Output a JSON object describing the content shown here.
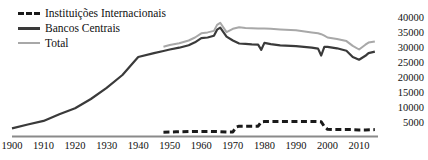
{
  "chart_data": {
    "type": "line",
    "title": "",
    "subtitle": "",
    "xlabel": "",
    "ylabel": "",
    "xlim": [
      1900,
      2016
    ],
    "ylim": [
      0,
      41000
    ],
    "grid": false,
    "legend_position": "top-left",
    "xticks": [
      1900,
      1910,
      1920,
      1930,
      1940,
      1950,
      1960,
      1970,
      1980,
      1990,
      2000,
      2010
    ],
    "xtick_labels": [
      "1900",
      "1910",
      "1920",
      "1930",
      "1940",
      "1950",
      "1960",
      "1970",
      "1980",
      "1990",
      "2000",
      "2010"
    ],
    "yticks": [
      5000,
      10000,
      15000,
      20000,
      25000,
      30000,
      35000,
      40000
    ],
    "ytick_labels": [
      "5000",
      "10000",
      "15000",
      "20000",
      "25000",
      "30000",
      "35000",
      "40000"
    ],
    "yaxis_side": "right",
    "series": [
      {
        "name": "Instituições Internacionais",
        "style": "dashed",
        "color": "#1a1a1a",
        "x": [
          1948,
          1950,
          1952,
          1954,
          1956,
          1958,
          1960,
          1962,
          1964,
          1966,
          1968,
          1970,
          1971,
          1972,
          1974,
          1976,
          1978,
          1979,
          1980,
          1982,
          1985,
          1990,
          1995,
          1997,
          1998,
          1999,
          2000,
          2002,
          2005,
          2008,
          2010,
          2012,
          2015
        ],
        "values": [
          1450,
          1500,
          1550,
          1600,
          1650,
          1700,
          1700,
          1700,
          1650,
          1600,
          1500,
          1500,
          3100,
          3450,
          3450,
          3450,
          3450,
          4900,
          5000,
          5000,
          5000,
          5000,
          5000,
          4950,
          4900,
          3300,
          2400,
          2300,
          2300,
          2300,
          2200,
          2200,
          2300
        ]
      },
      {
        "name": "Bancos Centrais",
        "style": "solid",
        "color": "#3a3a3a",
        "x": [
          1900,
          1905,
          1910,
          1915,
          1920,
          1925,
          1930,
          1935,
          1940,
          1945,
          1948,
          1950,
          1953,
          1956,
          1958,
          1960,
          1962,
          1964,
          1965,
          1966,
          1968,
          1970,
          1972,
          1974,
          1976,
          1978,
          1979,
          1980,
          1982,
          1985,
          1990,
          1995,
          1997,
          1998,
          1999,
          2000,
          2003,
          2006,
          2008,
          2010,
          2012,
          2013,
          2015
        ],
        "values": [
          2700,
          4000,
          5200,
          7400,
          9400,
          12500,
          16200,
          20500,
          26500,
          27800,
          28500,
          29000,
          29600,
          30400,
          31400,
          32800,
          33000,
          33600,
          35600,
          36300,
          33300,
          32000,
          31000,
          30900,
          30700,
          30600,
          28900,
          31200,
          30800,
          30400,
          30100,
          29600,
          29300,
          27000,
          29900,
          29900,
          29400,
          28600,
          26500,
          25600,
          26900,
          27800,
          28300
        ]
      },
      {
        "name": "Total",
        "style": "solid",
        "color": "#a8a8a8",
        "x": [
          1948,
          1950,
          1953,
          1956,
          1958,
          1960,
          1962,
          1964,
          1965,
          1966,
          1968,
          1970,
          1972,
          1974,
          1976,
          1978,
          1980,
          1982,
          1985,
          1990,
          1995,
          1997,
          1998,
          1999,
          2000,
          2003,
          2006,
          2008,
          2010,
          2012,
          2013,
          2015
        ],
        "values": [
          29900,
          30500,
          31100,
          32000,
          33000,
          34400,
          34700,
          35200,
          37200,
          37900,
          34800,
          35900,
          36400,
          36200,
          36100,
          36000,
          36000,
          35900,
          35700,
          35400,
          34700,
          34400,
          34100,
          33600,
          33000,
          32500,
          31800,
          30200,
          29000,
          30600,
          31300,
          31700
        ]
      }
    ]
  },
  "legend": {
    "items": [
      {
        "label": "Instituições Internacionais",
        "marker": "dashed-line-marker"
      },
      {
        "label": "Bancos Centrais",
        "marker": "solid-dark-line-marker"
      },
      {
        "label": "Total",
        "marker": "solid-gray-line-marker"
      }
    ]
  },
  "colors": {
    "international": "#1a1a1a",
    "central_banks": "#3a3a3a",
    "total": "#a8a8a8",
    "axis": "#888888",
    "text": "#111111"
  }
}
